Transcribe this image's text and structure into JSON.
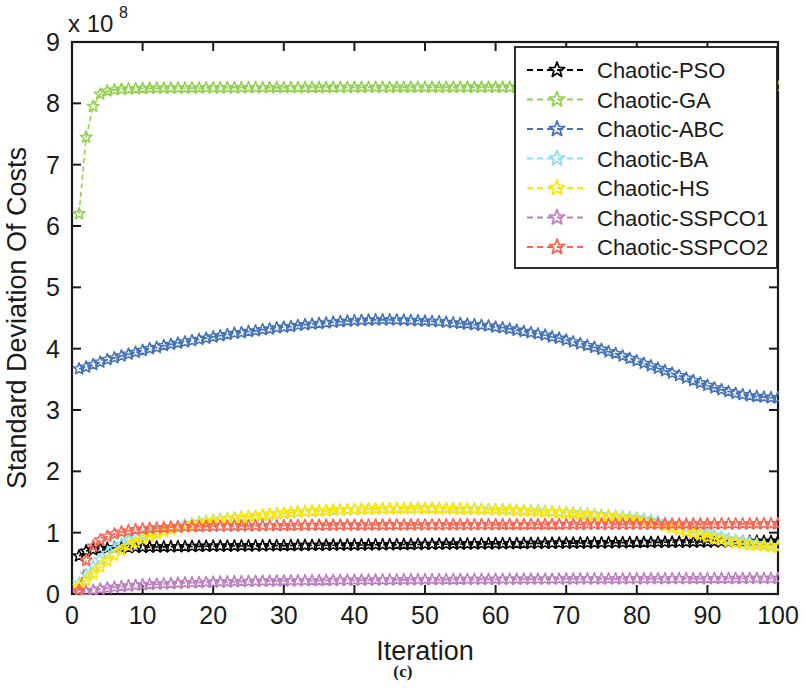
{
  "caption": "(c)",
  "chart_data": {
    "type": "line",
    "title": "",
    "xlabel": "Iteration",
    "ylabel": "Standard Deviation Of Costs",
    "y_multiplier_text": "x 10",
    "y_multiplier_exponent": "8",
    "y_scale": 100000000,
    "xlim": [
      0,
      100
    ],
    "ylim": [
      0,
      9
    ],
    "xticks": [
      0,
      10,
      20,
      30,
      40,
      50,
      60,
      70,
      80,
      90,
      100
    ],
    "yticks": [
      0,
      1,
      2,
      3,
      4,
      5,
      6,
      7,
      8,
      9
    ],
    "grid": false,
    "legend_position": "top-right",
    "marker": "star",
    "linestyle": "dashed",
    "x": [
      1,
      2,
      3,
      4,
      5,
      6,
      7,
      8,
      9,
      10,
      11,
      12,
      13,
      14,
      15,
      16,
      17,
      18,
      19,
      20,
      21,
      22,
      23,
      24,
      25,
      26,
      27,
      28,
      29,
      30,
      31,
      32,
      33,
      34,
      35,
      36,
      37,
      38,
      39,
      40,
      41,
      42,
      43,
      44,
      45,
      46,
      47,
      48,
      49,
      50,
      51,
      52,
      53,
      54,
      55,
      56,
      57,
      58,
      59,
      60,
      61,
      62,
      63,
      64,
      65,
      66,
      67,
      68,
      69,
      70,
      71,
      72,
      73,
      74,
      75,
      76,
      77,
      78,
      79,
      80,
      81,
      82,
      83,
      84,
      85,
      86,
      87,
      88,
      89,
      90,
      91,
      92,
      93,
      94,
      95,
      96,
      97,
      98,
      99,
      100
    ],
    "series": [
      {
        "name": "Chaotic-PSO",
        "color": "#000000",
        "values": [
          0.62,
          0.7,
          0.72,
          0.74,
          0.745,
          0.75,
          0.755,
          0.758,
          0.76,
          0.762,
          0.765,
          0.767,
          0.768,
          0.77,
          0.772,
          0.773,
          0.775,
          0.776,
          0.778,
          0.779,
          0.78,
          0.781,
          0.782,
          0.783,
          0.784,
          0.785,
          0.786,
          0.787,
          0.788,
          0.789,
          0.79,
          0.791,
          0.792,
          0.793,
          0.794,
          0.795,
          0.796,
          0.797,
          0.798,
          0.799,
          0.8,
          0.801,
          0.802,
          0.803,
          0.804,
          0.805,
          0.806,
          0.807,
          0.808,
          0.809,
          0.81,
          0.811,
          0.812,
          0.813,
          0.814,
          0.815,
          0.816,
          0.817,
          0.818,
          0.819,
          0.82,
          0.821,
          0.822,
          0.823,
          0.824,
          0.825,
          0.826,
          0.827,
          0.828,
          0.829,
          0.83,
          0.831,
          0.832,
          0.833,
          0.834,
          0.835,
          0.836,
          0.837,
          0.838,
          0.839,
          0.84,
          0.841,
          0.842,
          0.843,
          0.844,
          0.845,
          0.846,
          0.847,
          0.848,
          0.849,
          0.85,
          0.851,
          0.852,
          0.853,
          0.854,
          0.855,
          0.856,
          0.857,
          0.858,
          0.86
        ]
      },
      {
        "name": "Chaotic-GA",
        "color": "#92d050",
        "values": [
          6.2,
          7.45,
          7.95,
          8.15,
          8.2,
          8.22,
          8.23,
          8.235,
          8.24,
          8.242,
          8.245,
          8.246,
          8.248,
          8.249,
          8.25,
          8.25,
          8.251,
          8.251,
          8.252,
          8.252,
          8.253,
          8.253,
          8.254,
          8.254,
          8.255,
          8.255,
          8.255,
          8.256,
          8.256,
          8.256,
          8.257,
          8.257,
          8.257,
          8.258,
          8.258,
          8.258,
          8.258,
          8.259,
          8.259,
          8.259,
          8.259,
          8.26,
          8.26,
          8.26,
          8.26,
          8.26,
          8.26,
          8.261,
          8.261,
          8.261,
          8.261,
          8.261,
          8.261,
          8.261,
          8.262,
          8.262,
          8.262,
          8.262,
          8.262,
          8.262,
          8.262,
          8.262,
          8.262,
          8.262,
          8.262,
          8.262,
          8.262,
          8.262,
          8.262,
          8.262,
          8.262,
          8.262,
          8.262,
          8.262,
          8.262,
          8.262,
          8.262,
          8.262,
          8.262,
          8.262,
          8.262,
          8.262,
          8.262,
          8.262,
          8.262,
          8.262,
          8.262,
          8.262,
          8.262,
          8.262,
          8.262,
          8.262,
          8.262,
          8.262,
          8.262,
          8.262,
          8.262,
          8.262,
          8.262,
          8.262
        ]
      },
      {
        "name": "Chaotic-ABC",
        "color": "#4472b8",
        "values": [
          3.67,
          3.7,
          3.74,
          3.78,
          3.82,
          3.85,
          3.88,
          3.91,
          3.94,
          3.97,
          4.0,
          4.02,
          4.05,
          4.07,
          4.09,
          4.11,
          4.13,
          4.15,
          4.17,
          4.19,
          4.21,
          4.23,
          4.25,
          4.26,
          4.28,
          4.29,
          4.31,
          4.32,
          4.34,
          4.35,
          4.36,
          4.38,
          4.39,
          4.4,
          4.41,
          4.42,
          4.43,
          4.44,
          4.45,
          4.455,
          4.46,
          4.465,
          4.47,
          4.47,
          4.47,
          4.468,
          4.465,
          4.46,
          4.455,
          4.45,
          4.445,
          4.44,
          4.43,
          4.42,
          4.41,
          4.4,
          4.39,
          4.38,
          4.37,
          4.35,
          4.34,
          4.32,
          4.3,
          4.28,
          4.26,
          4.24,
          4.22,
          4.19,
          4.17,
          4.14,
          4.11,
          4.08,
          4.05,
          4.02,
          3.99,
          3.95,
          3.92,
          3.88,
          3.84,
          3.8,
          3.76,
          3.72,
          3.68,
          3.64,
          3.6,
          3.56,
          3.52,
          3.48,
          3.44,
          3.4,
          3.36,
          3.33,
          3.3,
          3.27,
          3.25,
          3.23,
          3.22,
          3.21,
          3.2,
          3.2
        ]
      },
      {
        "name": "Chaotic-BA",
        "color": "#8ddff0",
        "values": [
          0.18,
          0.32,
          0.45,
          0.56,
          0.66,
          0.74,
          0.81,
          0.87,
          0.92,
          0.96,
          1.0,
          1.03,
          1.06,
          1.09,
          1.11,
          1.13,
          1.15,
          1.17,
          1.19,
          1.2,
          1.22,
          1.23,
          1.24,
          1.25,
          1.26,
          1.27,
          1.28,
          1.29,
          1.3,
          1.31,
          1.32,
          1.33,
          1.34,
          1.345,
          1.35,
          1.355,
          1.36,
          1.365,
          1.37,
          1.375,
          1.38,
          1.382,
          1.385,
          1.387,
          1.39,
          1.392,
          1.393,
          1.394,
          1.395,
          1.395,
          1.395,
          1.394,
          1.393,
          1.392,
          1.39,
          1.388,
          1.385,
          1.382,
          1.38,
          1.377,
          1.374,
          1.37,
          1.366,
          1.362,
          1.358,
          1.353,
          1.348,
          1.342,
          1.336,
          1.33,
          1.323,
          1.316,
          1.308,
          1.3,
          1.29,
          1.28,
          1.27,
          1.26,
          1.25,
          1.24,
          1.22,
          1.2,
          1.18,
          1.16,
          1.14,
          1.11,
          1.08,
          1.05,
          1.02,
          0.99,
          0.96,
          0.93,
          0.9,
          0.88,
          0.86,
          0.84,
          0.82,
          0.8,
          0.79,
          0.78
        ]
      },
      {
        "name": "Chaotic-HS",
        "color": "#ffe600",
        "values": [
          0.12,
          0.22,
          0.33,
          0.44,
          0.54,
          0.63,
          0.71,
          0.78,
          0.84,
          0.89,
          0.94,
          0.98,
          1.02,
          1.05,
          1.08,
          1.11,
          1.13,
          1.15,
          1.17,
          1.19,
          1.21,
          1.22,
          1.24,
          1.25,
          1.26,
          1.27,
          1.29,
          1.3,
          1.31,
          1.32,
          1.33,
          1.34,
          1.345,
          1.35,
          1.355,
          1.36,
          1.365,
          1.37,
          1.375,
          1.38,
          1.383,
          1.386,
          1.388,
          1.39,
          1.392,
          1.393,
          1.394,
          1.395,
          1.395,
          1.394,
          1.393,
          1.392,
          1.39,
          1.388,
          1.386,
          1.383,
          1.38,
          1.377,
          1.374,
          1.37,
          1.366,
          1.362,
          1.357,
          1.352,
          1.347,
          1.342,
          1.336,
          1.33,
          1.323,
          1.316,
          1.308,
          1.3,
          1.29,
          1.28,
          1.27,
          1.26,
          1.25,
          1.235,
          1.22,
          1.2,
          1.18,
          1.16,
          1.14,
          1.11,
          1.08,
          1.05,
          1.02,
          0.99,
          0.96,
          0.93,
          0.9,
          0.88,
          0.86,
          0.84,
          0.82,
          0.8,
          0.79,
          0.78,
          0.77,
          0.76
        ]
      },
      {
        "name": "Chaotic-SSPCO1",
        "color": "#bb7fc0",
        "values": [
          0.02,
          0.04,
          0.06,
          0.08,
          0.095,
          0.11,
          0.12,
          0.13,
          0.14,
          0.15,
          0.155,
          0.16,
          0.165,
          0.17,
          0.175,
          0.18,
          0.183,
          0.186,
          0.19,
          0.192,
          0.195,
          0.197,
          0.2,
          0.202,
          0.204,
          0.206,
          0.208,
          0.21,
          0.211,
          0.213,
          0.214,
          0.216,
          0.217,
          0.218,
          0.219,
          0.22,
          0.221,
          0.222,
          0.223,
          0.224,
          0.225,
          0.226,
          0.227,
          0.228,
          0.229,
          0.23,
          0.231,
          0.232,
          0.232,
          0.233,
          0.234,
          0.234,
          0.235,
          0.236,
          0.236,
          0.237,
          0.237,
          0.238,
          0.238,
          0.239,
          0.239,
          0.24,
          0.24,
          0.241,
          0.241,
          0.242,
          0.242,
          0.243,
          0.243,
          0.244,
          0.244,
          0.245,
          0.245,
          0.246,
          0.246,
          0.246,
          0.247,
          0.247,
          0.248,
          0.248,
          0.248,
          0.249,
          0.249,
          0.249,
          0.25,
          0.25,
          0.25,
          0.251,
          0.251,
          0.251,
          0.252,
          0.252,
          0.252,
          0.253,
          0.253,
          0.253,
          0.254,
          0.254,
          0.254,
          0.255
        ]
      },
      {
        "name": "Chaotic-SSPCO2",
        "color": "#fa6450",
        "values": [
          0.06,
          0.55,
          0.78,
          0.88,
          0.94,
          0.98,
          1.01,
          1.03,
          1.05,
          1.06,
          1.07,
          1.077,
          1.083,
          1.088,
          1.092,
          1.095,
          1.098,
          1.1,
          1.102,
          1.104,
          1.106,
          1.108,
          1.109,
          1.11,
          1.111,
          1.112,
          1.113,
          1.114,
          1.115,
          1.116,
          1.117,
          1.118,
          1.119,
          1.12,
          1.12,
          1.121,
          1.121,
          1.122,
          1.122,
          1.123,
          1.123,
          1.124,
          1.124,
          1.125,
          1.125,
          1.126,
          1.126,
          1.126,
          1.127,
          1.127,
          1.127,
          1.128,
          1.128,
          1.128,
          1.129,
          1.129,
          1.129,
          1.13,
          1.13,
          1.13,
          1.131,
          1.131,
          1.131,
          1.132,
          1.132,
          1.132,
          1.133,
          1.133,
          1.133,
          1.134,
          1.134,
          1.134,
          1.135,
          1.135,
          1.135,
          1.136,
          1.136,
          1.136,
          1.137,
          1.137,
          1.137,
          1.138,
          1.138,
          1.138,
          1.139,
          1.139,
          1.139,
          1.14,
          1.14,
          1.14,
          1.141,
          1.141,
          1.142,
          1.142,
          1.143,
          1.143,
          1.144,
          1.144,
          1.145,
          1.146
        ]
      }
    ]
  }
}
